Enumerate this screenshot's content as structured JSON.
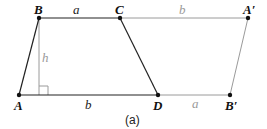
{
  "diagram": {
    "caption": "(a)",
    "colors": {
      "dark": "#222222",
      "grey": "#9a9a9a",
      "dot": "#111111"
    },
    "points": {
      "A": {
        "label": "A",
        "x": 19,
        "y": 95
      },
      "B": {
        "label": "B",
        "x": 39,
        "y": 18
      },
      "C": {
        "label": "C",
        "x": 120,
        "y": 18
      },
      "D": {
        "label": "D",
        "x": 158,
        "y": 95
      },
      "A_prime": {
        "label": "A′",
        "x": 248,
        "y": 18
      },
      "B_prime": {
        "label": "B′",
        "x": 230,
        "y": 95
      }
    },
    "segment_labels": {
      "BC": "a",
      "AD": "b",
      "CA_prime": "b",
      "DB_prime": "a",
      "height": "h"
    }
  }
}
